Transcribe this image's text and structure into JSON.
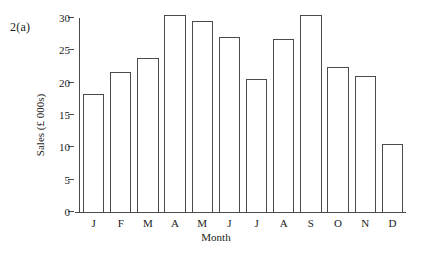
{
  "figure": {
    "label": "2(a)"
  },
  "chart_data": {
    "type": "bar",
    "title": "",
    "xlabel": "Month",
    "ylabel": "Sales (£ 000s)",
    "categories": [
      "J",
      "F",
      "M",
      "A",
      "M",
      "J",
      "J",
      "A",
      "S",
      "O",
      "N",
      "D"
    ],
    "category_names": [
      "January",
      "February",
      "March",
      "April",
      "May",
      "June",
      "July",
      "August",
      "September",
      "October",
      "November",
      "December"
    ],
    "values": [
      18.2,
      21.7,
      23.8,
      30.4,
      29.6,
      27.0,
      20.6,
      26.8,
      30.4,
      22.4,
      21.1,
      10.5
    ],
    "ylim": [
      0,
      30
    ],
    "ytick_values": [
      0,
      5,
      10,
      15,
      20,
      25,
      30
    ],
    "ytick_labels": [
      "0",
      "5",
      "10",
      "15",
      "20",
      "25",
      "30"
    ],
    "grid": false,
    "legend": false,
    "bar_fill_color": "#ffffff",
    "bar_edge_color": "#4a4a4a",
    "axis_color": "#4a4a4a",
    "background_color": "#ffffff"
  }
}
